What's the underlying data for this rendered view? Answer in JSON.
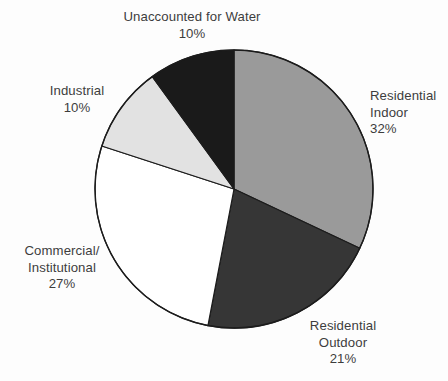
{
  "chart_data": {
    "type": "pie",
    "title": "",
    "subtitle": "",
    "legend_position": "outside-labels",
    "grid": false,
    "start_angle_deg": 0,
    "direction": "clockwise",
    "units": "percent",
    "total": 100,
    "categories": [
      "Residential Indoor",
      "Residential Outdoor",
      "Commercial/Institutional",
      "Industrial",
      "Unaccounted for Water"
    ],
    "values": [
      32,
      21,
      27,
      10,
      10
    ],
    "colors": [
      "#9a9a9a",
      "#363636",
      "#ffffff",
      "#e2e2e2",
      "#1a1a1a"
    ],
    "slices": [
      {
        "name": "Residential Indoor",
        "value": 32,
        "value_label": "32%",
        "color": "#9a9a9a",
        "start_deg": 0,
        "end_deg": 115.2,
        "label_lines": [
          "Residential",
          "Indoor",
          "32%"
        ]
      },
      {
        "name": "Residential Outdoor",
        "value": 21,
        "value_label": "21%",
        "color": "#363636",
        "start_deg": 115.2,
        "end_deg": 190.8,
        "label_lines": [
          "Residential",
          "Outdoor",
          "21%"
        ]
      },
      {
        "name": "Commercial/Institutional",
        "value": 27,
        "value_label": "27%",
        "color": "#ffffff",
        "start_deg": 190.8,
        "end_deg": 288.0,
        "label_lines": [
          "Commercial/",
          "Institutional",
          "27%"
        ]
      },
      {
        "name": "Industrial",
        "value": 10,
        "value_label": "10%",
        "color": "#e2e2e2",
        "start_deg": 288.0,
        "end_deg": 324.0,
        "label_lines": [
          "Industrial",
          "10%"
        ]
      },
      {
        "name": "Unaccounted for Water",
        "value": 10,
        "value_label": "10%",
        "color": "#1a1a1a",
        "start_deg": 324.0,
        "end_deg": 360.0,
        "label_lines": [
          "Unaccounted for Water",
          "10%"
        ]
      }
    ]
  },
  "labels": {
    "unaccounted": {
      "line1": "Unaccounted for Water",
      "line2": "10%"
    },
    "industrial": {
      "line1": "Industrial",
      "line2": "10%"
    },
    "commercial": {
      "line1": "Commercial/",
      "line2": "Institutional",
      "line3": "27%"
    },
    "indoor": {
      "line1": "Residential",
      "line2": "Indoor",
      "line3": "32%"
    },
    "outdoor": {
      "line1": "Residential",
      "line2": "Outdoor",
      "line3": "21%"
    }
  },
  "style": {
    "outline_color": "#1c1c1c",
    "text_color": "#3d3d3d",
    "background": "#fdfdfd"
  }
}
